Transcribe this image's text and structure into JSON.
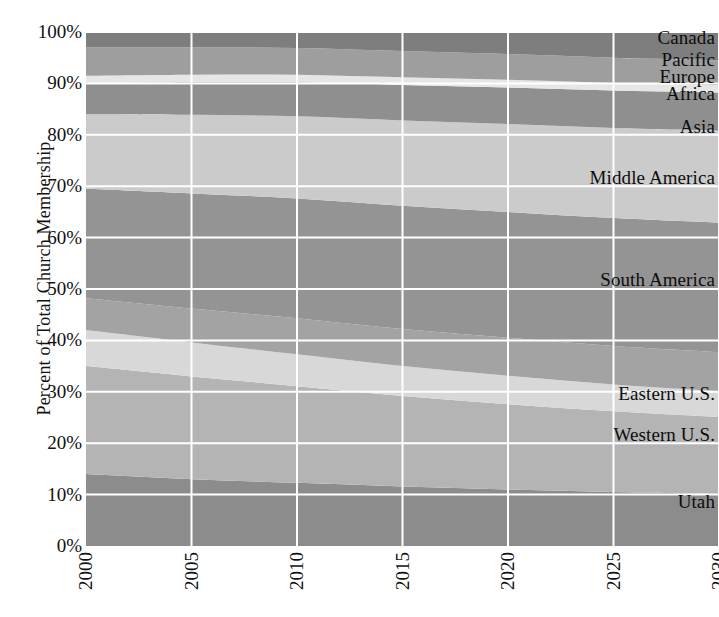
{
  "chart_data": {
    "type": "area",
    "title": "",
    "xlabel": "",
    "ylabel": "Percent of Total Church Membership",
    "stacked": true,
    "stack_mode": "percent",
    "grid": true,
    "legend_position": "inline-right",
    "xlim": [
      2000,
      2030
    ],
    "ylim": [
      0,
      100
    ],
    "x": [
      2000,
      2005,
      2010,
      2015,
      2020,
      2025,
      2030
    ],
    "xtick_labels": [
      "2000",
      "2005",
      "2010",
      "2015",
      "2020",
      "2025",
      "2030"
    ],
    "ytick_labels": [
      "0%",
      "10%",
      "20%",
      "30%",
      "40%",
      "50%",
      "60%",
      "70%",
      "80%",
      "90%",
      "100%"
    ],
    "ytick_values": [
      0,
      10,
      20,
      30,
      40,
      50,
      60,
      70,
      80,
      90,
      100
    ],
    "series": [
      {
        "name": "Utah",
        "color": "#8c8c8c",
        "values": [
          14.0,
          13.0,
          12.3,
          11.6,
          11.0,
          10.5,
          10.1
        ]
      },
      {
        "name": "Western U.S.",
        "color": "#b4b4b4",
        "values": [
          21.0,
          20.0,
          18.8,
          17.6,
          16.6,
          15.7,
          15.0
        ]
      },
      {
        "name": "Eastern U.S.",
        "color": "#d8d8d8",
        "values": [
          7.0,
          6.6,
          6.2,
          5.8,
          5.5,
          5.2,
          5.0
        ]
      },
      {
        "name": "South America",
        "color": "#a3a3a3",
        "values": [
          6.2,
          6.6,
          7.0,
          7.2,
          7.4,
          7.5,
          7.6
        ]
      },
      {
        "name": "Middle America",
        "color": "#949494",
        "values": [
          21.3,
          22.4,
          23.3,
          24.0,
          24.5,
          24.9,
          25.2
        ]
      },
      {
        "name": "Asia",
        "color": "#cbcbcb",
        "values": [
          14.5,
          15.3,
          16.0,
          16.6,
          17.1,
          17.5,
          17.9
        ]
      },
      {
        "name": "Africa",
        "color": "#8f8f8f",
        "values": [
          6.0,
          6.3,
          6.6,
          6.9,
          7.1,
          7.3,
          7.4
        ]
      },
      {
        "name": "Europe",
        "color": "#e6e6e6",
        "values": [
          1.5,
          1.5,
          1.5,
          1.5,
          1.5,
          1.5,
          1.5
        ]
      },
      {
        "name": "Pacific",
        "color": "#9e9e9e",
        "values": [
          5.5,
          5.3,
          5.2,
          5.1,
          5.0,
          4.9,
          4.8
        ]
      },
      {
        "name": "Canada",
        "color": "#7e7e7e",
        "values": [
          3.0,
          3.0,
          3.1,
          3.7,
          4.3,
          5.0,
          5.5
        ]
      }
    ],
    "series_label_positions": [
      {
        "name": "Canada",
        "y_pct": 98.8
      },
      {
        "name": "Pacific",
        "y_pct": 94.6
      },
      {
        "name": "Europe",
        "y_pct": 91.3
      },
      {
        "name": "Africa",
        "y_pct": 88.0
      },
      {
        "name": "Asia",
        "y_pct": 81.5
      },
      {
        "name": "Middle America",
        "y_pct": 71.5
      },
      {
        "name": "South America",
        "y_pct": 51.8
      },
      {
        "name": "Eastern U.S.",
        "y_pct": 29.5
      },
      {
        "name": "Western U.S.",
        "y_pct": 21.5
      },
      {
        "name": "Utah",
        "y_pct": 8.5
      }
    ],
    "gridline_color": "#ffffff",
    "background_color": "#ffffff",
    "axis_text_color": "#111111"
  }
}
